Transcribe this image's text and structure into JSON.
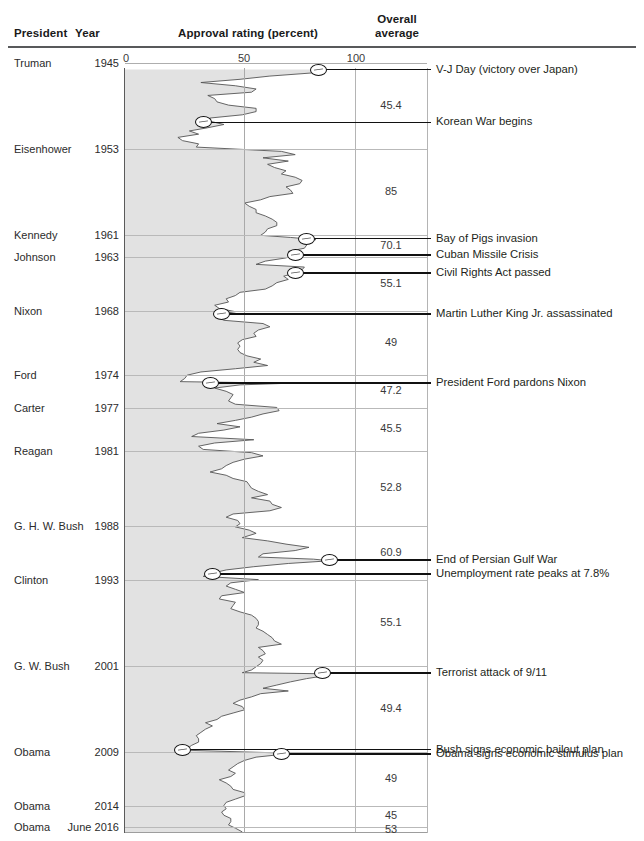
{
  "header": {
    "col_president": "President",
    "col_year": "Year",
    "col_approval": "Approval rating (percent)",
    "col_overall_line1": "Overall",
    "col_overall_line2": "average"
  },
  "axis": {
    "ticks": [
      "0",
      "50",
      "100"
    ],
    "min": 0,
    "max": 100
  },
  "rows": [
    {
      "president": "Truman",
      "year": "1945",
      "average": "45.4"
    },
    {
      "president": "Eisenhower",
      "year": "1953",
      "average": "85"
    },
    {
      "president": "Kennedy",
      "year": "1961",
      "average": "70.1"
    },
    {
      "president": "Johnson",
      "year": "1963",
      "average": "55.1"
    },
    {
      "president": "Nixon",
      "year": "1968",
      "average": "49"
    },
    {
      "president": "Ford",
      "year": "1974",
      "average": "47.2"
    },
    {
      "president": "Carter",
      "year": "1977",
      "average": "45.5"
    },
    {
      "president": "Reagan",
      "year": "1981",
      "average": "52.8"
    },
    {
      "president": "G. H. W. Bush",
      "year": "1988",
      "average": "60.9"
    },
    {
      "president": "Clinton",
      "year": "1993",
      "average": "55.1"
    },
    {
      "president": "G. W. Bush",
      "year": "2001",
      "average": "49.4"
    },
    {
      "president": "Obama",
      "year": "2009",
      "average": "49"
    },
    {
      "president": "Obama",
      "year": "2014",
      "average": "45"
    },
    {
      "president": "Obama",
      "year": "June 2016",
      "average": "53"
    }
  ],
  "annotations": [
    {
      "label": "V-J Day (victory over Japan)",
      "value": 84,
      "year": 1945.6
    },
    {
      "label": "Korean War begins",
      "value": 34,
      "year": 1950.5
    },
    {
      "label": "Bay of Pigs invasion",
      "value": 79,
      "year": 1961.3
    },
    {
      "label": "Cuban Missile Crisis",
      "value": 74,
      "year": 1962.8
    },
    {
      "label": "Civil Rights Act passed",
      "value": 74,
      "year": 1964.5
    },
    {
      "label": "Martin Luther King Jr. assassinated",
      "value": 42,
      "year": 1968.3
    },
    {
      "label": "President Ford pardons Nixon",
      "value": 37,
      "year": 1974.7
    },
    {
      "label": "End of Persian Gulf War",
      "value": 89,
      "year": 1991.2
    },
    {
      "label": "Unemployment rate peaks at 7.8%",
      "value": 38,
      "year": 1992.5
    },
    {
      "label": "Terrorist attack of 9/11",
      "value": 86,
      "year": 2001.7
    },
    {
      "label": "Bush signs economic bailout plan",
      "value": 25,
      "year": 2008.8
    },
    {
      "label": "Obama signs economic stimulus plan",
      "value": 68,
      "year": 2009.2
    }
  ],
  "colors": {
    "line": "#555555",
    "fill": "#e2e2e2",
    "rule": "#58595b",
    "grid": "#b9b9b9",
    "annotation": "#111111",
    "text": "#231f20"
  },
  "chart_data": {
    "type": "line",
    "title": "Approval rating (percent)",
    "xlabel": "Approval rating (percent)",
    "ylabel": "Year",
    "xlim": [
      0,
      100
    ],
    "ylim": [
      1945,
      2016.5
    ],
    "grid": true,
    "orientation": "vertical-time",
    "legend": "none",
    "note": "Presidential job-approval series plotted with time running downward; gray band is the area fill from 0 to the rating.",
    "series": [
      {
        "name": "Presidential approval rating",
        "points": [
          [
            1945.6,
            87
          ],
          [
            1945.9,
            82
          ],
          [
            1946.2,
            63
          ],
          [
            1946.5,
            50
          ],
          [
            1946.8,
            33
          ],
          [
            1947.1,
            48
          ],
          [
            1947.4,
            57
          ],
          [
            1947.7,
            55
          ],
          [
            1948.0,
            36
          ],
          [
            1948.3,
            39
          ],
          [
            1948.6,
            40
          ],
          [
            1948.9,
            45
          ],
          [
            1949.2,
            57
          ],
          [
            1949.5,
            57
          ],
          [
            1949.8,
            51
          ],
          [
            1950.1,
            37
          ],
          [
            1950.4,
            37
          ],
          [
            1950.7,
            43
          ],
          [
            1951.0,
            36
          ],
          [
            1951.3,
            28
          ],
          [
            1951.6,
            32
          ],
          [
            1951.9,
            23
          ],
          [
            1952.2,
            25
          ],
          [
            1952.5,
            32
          ],
          [
            1952.8,
            31
          ],
          [
            1953.2,
            68
          ],
          [
            1953.5,
            74
          ],
          [
            1953.8,
            60
          ],
          [
            1954.1,
            71
          ],
          [
            1954.4,
            62
          ],
          [
            1954.7,
            65
          ],
          [
            1955.0,
            70
          ],
          [
            1955.3,
            68
          ],
          [
            1955.6,
            74
          ],
          [
            1955.9,
            77
          ],
          [
            1956.2,
            76
          ],
          [
            1956.5,
            70
          ],
          [
            1956.8,
            72
          ],
          [
            1957.1,
            73
          ],
          [
            1957.4,
            63
          ],
          [
            1957.7,
            59
          ],
          [
            1958.0,
            52
          ],
          [
            1958.3,
            54
          ],
          [
            1958.6,
            57
          ],
          [
            1958.9,
            57
          ],
          [
            1959.2,
            61
          ],
          [
            1959.5,
            64
          ],
          [
            1959.8,
            66
          ],
          [
            1960.1,
            66
          ],
          [
            1960.4,
            62
          ],
          [
            1960.7,
            61
          ],
          [
            1961.0,
            59
          ],
          [
            1961.2,
            72
          ],
          [
            1961.4,
            83
          ],
          [
            1961.6,
            76
          ],
          [
            1961.9,
            79
          ],
          [
            1962.2,
            78
          ],
          [
            1962.5,
            71
          ],
          [
            1962.8,
            74
          ],
          [
            1963.1,
            70
          ],
          [
            1963.4,
            61
          ],
          [
            1963.7,
            57
          ],
          [
            1963.95,
            78
          ],
          [
            1964.2,
            77
          ],
          [
            1964.5,
            74
          ],
          [
            1964.8,
            69
          ],
          [
            1965.1,
            71
          ],
          [
            1965.4,
            66
          ],
          [
            1965.7,
            64
          ],
          [
            1966.0,
            61
          ],
          [
            1966.3,
            50
          ],
          [
            1966.6,
            48
          ],
          [
            1966.9,
            44
          ],
          [
            1967.2,
            45
          ],
          [
            1967.5,
            39
          ],
          [
            1967.8,
            41
          ],
          [
            1968.1,
            48
          ],
          [
            1968.3,
            42
          ],
          [
            1968.6,
            40
          ],
          [
            1968.9,
            43
          ],
          [
            1969.2,
            60
          ],
          [
            1969.5,
            63
          ],
          [
            1969.8,
            58
          ],
          [
            1970.1,
            56
          ],
          [
            1970.4,
            57
          ],
          [
            1970.7,
            51
          ],
          [
            1971.0,
            49
          ],
          [
            1971.3,
            50
          ],
          [
            1971.6,
            49
          ],
          [
            1971.9,
            50
          ],
          [
            1972.2,
            53
          ],
          [
            1972.5,
            59
          ],
          [
            1972.8,
            56
          ],
          [
            1973.1,
            62
          ],
          [
            1973.4,
            48
          ],
          [
            1973.7,
            33
          ],
          [
            1974.0,
            27
          ],
          [
            1974.3,
            26
          ],
          [
            1974.6,
            24
          ],
          [
            1974.75,
            71
          ],
          [
            1974.9,
            50
          ],
          [
            1975.2,
            39
          ],
          [
            1975.5,
            44
          ],
          [
            1975.8,
            47
          ],
          [
            1976.1,
            46
          ],
          [
            1976.4,
            45
          ],
          [
            1976.7,
            48
          ],
          [
            1977.0,
            66
          ],
          [
            1977.3,
            67
          ],
          [
            1977.6,
            60
          ],
          [
            1977.9,
            55
          ],
          [
            1978.2,
            48
          ],
          [
            1978.5,
            40
          ],
          [
            1978.8,
            50
          ],
          [
            1979.1,
            43
          ],
          [
            1979.4,
            32
          ],
          [
            1979.7,
            29
          ],
          [
            1980.0,
            56
          ],
          [
            1980.3,
            39
          ],
          [
            1980.6,
            32
          ],
          [
            1980.9,
            34
          ],
          [
            1981.2,
            55
          ],
          [
            1981.5,
            60
          ],
          [
            1981.8,
            52
          ],
          [
            1982.1,
            47
          ],
          [
            1982.4,
            44
          ],
          [
            1982.7,
            42
          ],
          [
            1983.0,
            37
          ],
          [
            1983.3,
            44
          ],
          [
            1983.6,
            47
          ],
          [
            1983.9,
            53
          ],
          [
            1984.2,
            54
          ],
          [
            1984.5,
            55
          ],
          [
            1984.8,
            58
          ],
          [
            1985.1,
            62
          ],
          [
            1985.4,
            55
          ],
          [
            1985.7,
            63
          ],
          [
            1986.0,
            64
          ],
          [
            1986.3,
            68
          ],
          [
            1986.6,
            63
          ],
          [
            1986.9,
            47
          ],
          [
            1987.2,
            44
          ],
          [
            1987.5,
            49
          ],
          [
            1987.8,
            50
          ],
          [
            1988.1,
            48
          ],
          [
            1988.4,
            54
          ],
          [
            1988.7,
            57
          ],
          [
            1989.1,
            51
          ],
          [
            1989.4,
            62
          ],
          [
            1989.7,
            70
          ],
          [
            1990.0,
            80
          ],
          [
            1990.3,
            74
          ],
          [
            1990.6,
            60
          ],
          [
            1990.9,
            58
          ],
          [
            1991.1,
            82
          ],
          [
            1991.25,
            89
          ],
          [
            1991.5,
            71
          ],
          [
            1991.8,
            56
          ],
          [
            1992.1,
            44
          ],
          [
            1992.4,
            38
          ],
          [
            1992.7,
            34
          ],
          [
            1993.0,
            58
          ],
          [
            1993.3,
            46
          ],
          [
            1993.6,
            44
          ],
          [
            1993.9,
            48
          ],
          [
            1994.2,
            52
          ],
          [
            1994.5,
            42
          ],
          [
            1994.8,
            41
          ],
          [
            1995.1,
            48
          ],
          [
            1995.4,
            47
          ],
          [
            1995.7,
            46
          ],
          [
            1996.0,
            50
          ],
          [
            1996.3,
            55
          ],
          [
            1996.6,
            57
          ],
          [
            1996.9,
            58
          ],
          [
            1997.2,
            58
          ],
          [
            1997.5,
            57
          ],
          [
            1997.8,
            60
          ],
          [
            1998.1,
            62
          ],
          [
            1998.4,
            64
          ],
          [
            1998.7,
            65
          ],
          [
            1999.0,
            68
          ],
          [
            1999.3,
            58
          ],
          [
            1999.6,
            60
          ],
          [
            1999.9,
            61
          ],
          [
            2000.2,
            58
          ],
          [
            2000.5,
            60
          ],
          [
            2000.8,
            59
          ],
          [
            2001.1,
            57
          ],
          [
            2001.4,
            55
          ],
          [
            2001.65,
            51
          ],
          [
            2001.75,
            86
          ],
          [
            2001.9,
            88
          ],
          [
            2002.2,
            79
          ],
          [
            2002.5,
            72
          ],
          [
            2002.8,
            66
          ],
          [
            2003.1,
            60
          ],
          [
            2003.35,
            71
          ],
          [
            2003.6,
            59
          ],
          [
            2003.9,
            55
          ],
          [
            2004.2,
            50
          ],
          [
            2004.5,
            47
          ],
          [
            2004.8,
            51
          ],
          [
            2005.1,
            52
          ],
          [
            2005.4,
            47
          ],
          [
            2005.7,
            42
          ],
          [
            2006.0,
            40
          ],
          [
            2006.3,
            35
          ],
          [
            2006.6,
            38
          ],
          [
            2006.9,
            35
          ],
          [
            2007.2,
            33
          ],
          [
            2007.5,
            31
          ],
          [
            2007.8,
            32
          ],
          [
            2008.1,
            32
          ],
          [
            2008.4,
            29
          ],
          [
            2008.7,
            27
          ],
          [
            2008.85,
            25
          ],
          [
            2009.1,
            66
          ],
          [
            2009.25,
            68
          ],
          [
            2009.5,
            57
          ],
          [
            2009.8,
            52
          ],
          [
            2010.1,
            49
          ],
          [
            2010.4,
            47
          ],
          [
            2010.7,
            45
          ],
          [
            2011.0,
            48
          ],
          [
            2011.3,
            46
          ],
          [
            2011.6,
            41
          ],
          [
            2011.9,
            44
          ],
          [
            2012.2,
            46
          ],
          [
            2012.5,
            47
          ],
          [
            2012.8,
            52
          ],
          [
            2013.1,
            52
          ],
          [
            2013.4,
            48
          ],
          [
            2013.7,
            44
          ],
          [
            2014.0,
            43
          ],
          [
            2014.3,
            44
          ],
          [
            2014.6,
            42
          ],
          [
            2014.9,
            43
          ],
          [
            2015.2,
            46
          ],
          [
            2015.5,
            46
          ],
          [
            2015.8,
            45
          ],
          [
            2016.1,
            48
          ],
          [
            2016.45,
            51
          ]
        ]
      }
    ]
  }
}
